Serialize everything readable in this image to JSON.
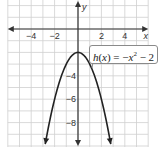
{
  "chart_data": {
    "type": "line",
    "title": "",
    "function_label": "h(x) = −x² − 2",
    "equation": "h(x) = -x^2 - 2",
    "xlabel": "x",
    "ylabel": "y",
    "xlim": [
      -6,
      6
    ],
    "ylim": [
      -10,
      2.5
    ],
    "grid": true,
    "x_ticks": [
      -4,
      -2,
      2,
      4
    ],
    "y_ticks": [
      -4,
      -6,
      -8
    ],
    "x_tick_labels": [
      "−4",
      "−2",
      "2",
      "4"
    ],
    "y_tick_labels": [
      "−4",
      "−6",
      "−8"
    ],
    "series": [
      {
        "name": "h(x)",
        "x": [
          -2.8,
          -2.5,
          -2,
          -1.5,
          -1,
          -0.5,
          0,
          0.5,
          1,
          1.5,
          2,
          2.5,
          2.8
        ],
        "y": [
          -9.84,
          -8.25,
          -6,
          -4.25,
          -3,
          -2.25,
          -2,
          -2.25,
          -3,
          -4.25,
          -6,
          -8.25,
          -9.84
        ]
      }
    ],
    "vertex": [
      0,
      -2
    ]
  },
  "labels": {
    "x_axis": "x",
    "y_axis": "y",
    "callout": "h(x) = −x² − 2",
    "callout_parts": {
      "h": "h",
      "open": "(",
      "x": "x",
      "close": ") = −",
      "x2": "x",
      "sup": "2",
      "rest": " − 2"
    }
  },
  "colors": {
    "grid": "#c8c8c8",
    "axis": "#333333",
    "curve": "#222222"
  }
}
